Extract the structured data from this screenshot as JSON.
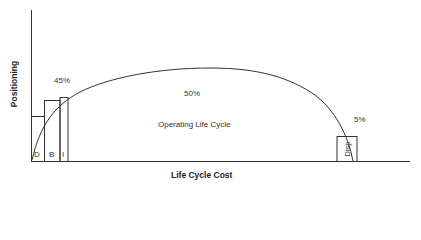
{
  "axes": {
    "y_label": "Positioning",
    "x_label": "Life Cycle Cost"
  },
  "phases": {
    "design": "D",
    "build": "B",
    "install": "I",
    "disposal": "Disp"
  },
  "annotations": {
    "early_pct": "45%",
    "operating_pct": "50%",
    "operating_label": "Operating Life Cycle",
    "disposal_pct": "5%"
  },
  "colors": {
    "line": "#333333",
    "text": "#333333"
  }
}
